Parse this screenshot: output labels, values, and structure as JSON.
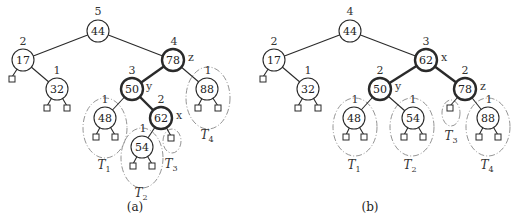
{
  "figure": {
    "panels": [
      {
        "caption": "(a)",
        "root": {
          "key": "44",
          "height": "5"
        },
        "nodes": [
          {
            "id": "n44",
            "key": "44",
            "height": "5",
            "x": 98,
            "y": 31,
            "bold": false
          },
          {
            "id": "n17",
            "key": "17",
            "height": "2",
            "x": 23,
            "y": 60,
            "bold": false
          },
          {
            "id": "n32",
            "key": "32",
            "height": "1",
            "x": 57,
            "y": 89,
            "bold": false
          },
          {
            "id": "n78",
            "key": "78",
            "height": "4",
            "x": 173,
            "y": 60,
            "bold": true,
            "label": "z"
          },
          {
            "id": "n50",
            "key": "50",
            "height": "3",
            "x": 132,
            "y": 89,
            "bold": true,
            "label": "y"
          },
          {
            "id": "n88",
            "key": "88",
            "height": "1",
            "x": 207,
            "y": 89,
            "bold": false
          },
          {
            "id": "n48",
            "key": "48",
            "height": "1",
            "x": 105,
            "y": 118,
            "bold": false
          },
          {
            "id": "n62",
            "key": "62",
            "height": "2",
            "x": 161,
            "y": 118,
            "bold": true,
            "label": "x"
          },
          {
            "id": "n54",
            "key": "54",
            "height": "1",
            "x": 142,
            "y": 147,
            "bold": false
          }
        ],
        "subtrees": [
          {
            "name": "T",
            "sub": "1",
            "label_x": 105,
            "label_y": 165
          },
          {
            "name": "T",
            "sub": "2",
            "label_x": 142,
            "label_y": 193
          },
          {
            "name": "T",
            "sub": "3",
            "label_x": 172,
            "label_y": 165
          },
          {
            "name": "T",
            "sub": "4",
            "label_x": 208,
            "label_y": 136
          }
        ]
      },
      {
        "caption": "(b)",
        "root": {
          "key": "44",
          "height": "4"
        },
        "nodes": [
          {
            "id": "m44",
            "key": "44",
            "height": "4",
            "x": 350,
            "y": 31,
            "bold": false
          },
          {
            "id": "m17",
            "key": "17",
            "height": "2",
            "x": 274,
            "y": 60,
            "bold": false
          },
          {
            "id": "m32",
            "key": "32",
            "height": "1",
            "x": 308,
            "y": 89,
            "bold": false
          },
          {
            "id": "m62",
            "key": "62",
            "height": "3",
            "x": 426,
            "y": 60,
            "bold": true,
            "label": "x"
          },
          {
            "id": "m50",
            "key": "50",
            "height": "2",
            "x": 380,
            "y": 89,
            "bold": true,
            "label": "y"
          },
          {
            "id": "m78",
            "key": "78",
            "height": "2",
            "x": 465,
            "y": 89,
            "bold": true,
            "label": "z"
          },
          {
            "id": "m48",
            "key": "48",
            "height": "1",
            "x": 354,
            "y": 118,
            "bold": false
          },
          {
            "id": "m54",
            "key": "54",
            "height": "1",
            "x": 413,
            "y": 118,
            "bold": false
          },
          {
            "id": "m88",
            "key": "88",
            "height": "1",
            "x": 488,
            "y": 118,
            "bold": false
          }
        ],
        "subtrees": [
          {
            "name": "T",
            "sub": "1",
            "label_x": 355,
            "label_y": 166
          },
          {
            "name": "T",
            "sub": "2",
            "label_x": 411,
            "label_y": 166
          },
          {
            "name": "T",
            "sub": "3",
            "label_x": 452,
            "label_y": 137
          },
          {
            "name": "T",
            "sub": "4",
            "label_x": 488,
            "label_y": 166
          }
        ]
      }
    ]
  },
  "labels": {
    "a": {
      "h44": "5",
      "k44": "44",
      "h17": "2",
      "k17": "17",
      "h32": "1",
      "k32": "32",
      "h78": "4",
      "k78": "78",
      "z": "z",
      "h50": "3",
      "k50": "50",
      "y": "y",
      "h88": "1",
      "k88": "88",
      "h48": "1",
      "k48": "48",
      "h62": "2",
      "k62": "62",
      "x": "x",
      "h54": "1",
      "k54": "54",
      "T": "T",
      "s1": "1",
      "s2": "2",
      "s3": "3",
      "s4": "4",
      "caption": "(a)"
    },
    "b": {
      "h44": "4",
      "k44": "44",
      "h17": "2",
      "k17": "17",
      "h32": "1",
      "k32": "32",
      "h62": "3",
      "k62": "62",
      "x": "x",
      "h50": "2",
      "k50": "50",
      "y": "y",
      "h78": "2",
      "k78": "78",
      "z": "z",
      "h48": "1",
      "k48": "48",
      "h54": "1",
      "k54": "54",
      "h88": "1",
      "k88": "88",
      "T": "T",
      "s1": "1",
      "s2": "2",
      "s3": "3",
      "s4": "4",
      "caption": "(b)"
    }
  }
}
